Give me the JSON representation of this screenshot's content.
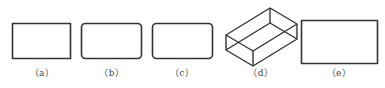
{
  "figure": {
    "stroke_color": "#333333",
    "background": "#ffffff",
    "panels": [
      {
        "id": "a",
        "label": "（a）",
        "shape": "rectangle-sharp-corners",
        "label_x": 42
      },
      {
        "id": "b",
        "label": "（b）",
        "shape": "rectangle-rounded-corners",
        "label_x": 112
      },
      {
        "id": "c",
        "label": "（c）",
        "shape": "rectangle-rounded-corners",
        "label_x": 182
      },
      {
        "id": "d",
        "label": "（d）",
        "shape": "isometric-rectangular-prism-wireframe",
        "label_x": 261
      },
      {
        "id": "e",
        "label": "（e）",
        "shape": "rectangle-large-sharp-corners",
        "label_x": 339
      }
    ]
  }
}
